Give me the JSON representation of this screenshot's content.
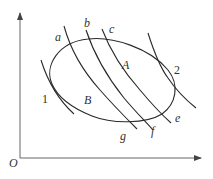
{
  "diagram": {
    "type": "thermodynamic-cycle-with-adiabats",
    "axes": {
      "origin_label": "O",
      "x_label": "",
      "y_label": ""
    },
    "cycle": {
      "points": [
        {
          "id": "1",
          "label": "1"
        },
        {
          "id": "2",
          "label": "2"
        }
      ],
      "regions": [
        {
          "id": "A",
          "label": "A"
        },
        {
          "id": "B",
          "label": "B"
        }
      ]
    },
    "curves": [
      {
        "id": "tangent-1",
        "label": ""
      },
      {
        "id": "tangent-2",
        "label": ""
      },
      {
        "id": "a-g",
        "start_label": "a",
        "end_label": "g"
      },
      {
        "id": "b-f",
        "start_label": "b",
        "end_label": "f"
      },
      {
        "id": "c-e",
        "start_label": "c",
        "end_label": "e"
      }
    ],
    "colors": {
      "line": "#2a2a2a",
      "axis": "#555555",
      "background": "#ffffff"
    }
  }
}
